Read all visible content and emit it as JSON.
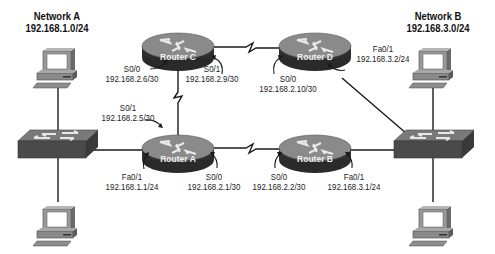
{
  "networks": [
    {
      "name": "Network A",
      "subnet": "192.168.1.0/24"
    },
    {
      "name": "Network B",
      "subnet": "192.168.3.0/24"
    }
  ],
  "routers": [
    {
      "name": "Router C"
    },
    {
      "name": "Router D"
    },
    {
      "name": "Router A"
    },
    {
      "name": "Router B"
    }
  ],
  "interfaces": {
    "router_c_s00": {
      "port": "S0/0",
      "ip": "192.168.2.6/30"
    },
    "router_c_s01": {
      "port": "S0/1",
      "ip": "192.168.2.9/30"
    },
    "router_d_s00": {
      "port": "S0/0",
      "ip": "192.168.2.10/30"
    },
    "router_d_fa01": {
      "port": "Fa0/1",
      "ip": "192.168.3.2/24"
    },
    "router_a_s01": {
      "port": "S0/1",
      "ip": "192.168.2.5/30"
    },
    "router_a_fa01": {
      "port": "Fa0/1",
      "ip": "192.168.1.1/24"
    },
    "router_a_s00": {
      "port": "S0/0",
      "ip": "192.168.2.1/30"
    },
    "router_b_s00": {
      "port": "S0/0",
      "ip": "192.168.2.2/30"
    },
    "router_b_fa01": {
      "port": "Fa0/1",
      "ip": "192.168.3.1/24"
    }
  },
  "devices": {
    "switches": [
      "switch-a",
      "switch-b"
    ],
    "hosts": [
      "host-a1",
      "host-a2",
      "host-b1",
      "host-b2"
    ]
  },
  "colors": {
    "router_top": "#8a8a8a",
    "router_side": "#2e2e2e",
    "switch_top": "#7a7a7a",
    "switch_side": "#4a4a4a",
    "link": "#1a1a1a"
  }
}
